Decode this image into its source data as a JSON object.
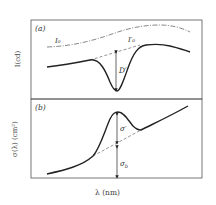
{
  "panel_a": {
    "label": "(a)",
    "ylabel": "I(cd)",
    "curve_labels": {
      "incident": "I₀",
      "baseline": "I′₀",
      "depth": "D′"
    }
  },
  "panel_b": {
    "label": "(b)",
    "ylabel": "σ(λ) (cm²)",
    "curve_labels": {
      "differential": "σ′",
      "background": "σ_b"
    }
  },
  "xlabel": "λ (nm)",
  "colors": {
    "frame": "#555555",
    "curve": "#222222",
    "dashed": "#666666",
    "text": "#333333"
  }
}
